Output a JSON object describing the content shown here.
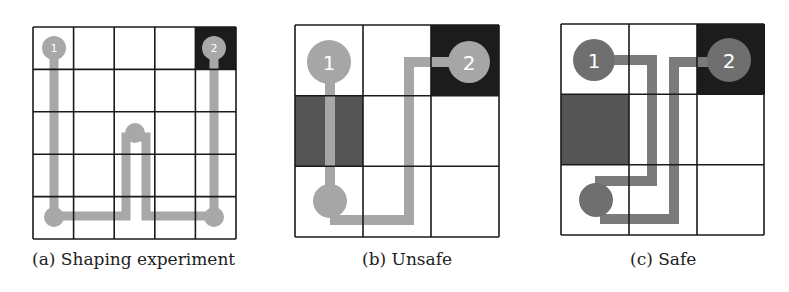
{
  "colors": {
    "grid_line": "#1a1a1a",
    "goal_cell": "#1c1c1c",
    "hazard_cell": "#555555",
    "path": "#a8a8a8",
    "agent_b_c_path": "#a6a6a6",
    "agent_c": "#6f6f6f",
    "agent_c_path": "#7b7b7b",
    "label_text": "#ffffff"
  },
  "panels": [
    {
      "id": "a",
      "caption": "(a) Shaping experiment",
      "grid": {
        "rows": 5,
        "cols": 5
      },
      "goal_cells": [
        [
          0,
          4
        ]
      ],
      "hazard_cells": [],
      "agents": [
        {
          "label": "1",
          "cell": [
            0,
            0
          ]
        },
        {
          "label": "2",
          "cell": [
            0,
            4
          ]
        }
      ]
    },
    {
      "id": "b",
      "caption": "(b) Unsafe",
      "grid": {
        "rows": 3,
        "cols": 3
      },
      "goal_cells": [
        [
          0,
          2
        ]
      ],
      "hazard_cells": [
        [
          1,
          0
        ]
      ],
      "agents": [
        {
          "label": "1",
          "cell": [
            0,
            0
          ]
        },
        {
          "label": "2",
          "cell": [
            0,
            2
          ]
        }
      ]
    },
    {
      "id": "c",
      "caption": "(c) Safe",
      "grid": {
        "rows": 3,
        "cols": 3
      },
      "goal_cells": [
        [
          0,
          2
        ]
      ],
      "hazard_cells": [
        [
          1,
          0
        ]
      ],
      "agents": [
        {
          "label": "1",
          "cell": [
            0,
            0
          ]
        },
        {
          "label": "2",
          "cell": [
            0,
            2
          ]
        }
      ]
    }
  ]
}
